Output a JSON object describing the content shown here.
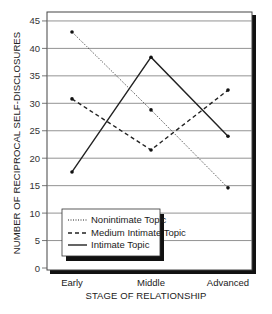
{
  "chart_data": {
    "type": "line",
    "title": "",
    "xlabel": "STAGE OF RELATIONSHIP",
    "ylabel": "NUMBER OF RECIPROCAL SELF-DISCLOSURES",
    "categories": [
      "Early",
      "Middle",
      "Advanced"
    ],
    "yticks": [
      0,
      5,
      10,
      15,
      20,
      25,
      30,
      35,
      40,
      45
    ],
    "ylim": [
      0,
      47
    ],
    "grid": true,
    "legend_position": "lower-left inside",
    "series": [
      {
        "name": "Nonintimate Topic",
        "style": "dotted",
        "values": [
          43,
          28.8,
          14.6
        ]
      },
      {
        "name": "Medium Intimate Topic",
        "style": "dashed",
        "values": [
          30.8,
          21.5,
          32.4
        ]
      },
      {
        "name": "Intimate Topic",
        "style": "solid",
        "values": [
          17.5,
          38.4,
          24
        ]
      }
    ]
  },
  "axis": {
    "x_title": "STAGE OF RELATIONSHIP",
    "y_title": "NUMBER OF RECIPROCAL SELF-DISCLOSURES",
    "x_labels": [
      "Early",
      "Middle",
      "Advanced"
    ],
    "y_labels": [
      "0",
      "5",
      "10",
      "15",
      "20",
      "25",
      "30",
      "35",
      "40",
      "45"
    ]
  },
  "legend": {
    "items": [
      "Nonintimate Topic",
      "Medium Intimate Topic",
      "Intimate Topic"
    ]
  }
}
